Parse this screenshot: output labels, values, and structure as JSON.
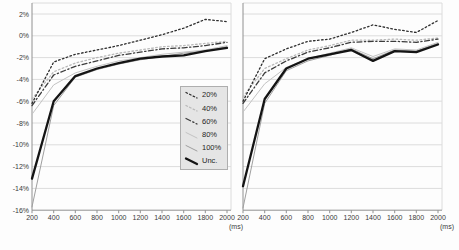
{
  "figure": {
    "background": "#fdfdfd",
    "grid_color": "#dcdcdc",
    "axis_color": "#909090",
    "text_color": "#3a3a3a",
    "legend_bg": "#e5e5e5",
    "legend_border": "#aeaeae",
    "y_axis": {
      "tick_labels": [
        "2%",
        "0%",
        "-2%",
        "-4%",
        "-6%",
        "-8%",
        "-10%",
        "-12%",
        "-14%",
        "-16%"
      ],
      "tick_values": [
        2,
        0,
        -2,
        -4,
        -6,
        -8,
        -10,
        -12,
        -14,
        -16
      ],
      "max": 3,
      "min": -16
    },
    "x_axis": {
      "tick_labels": [
        "200",
        "400",
        "600",
        "800",
        "1000",
        "1200",
        "1400",
        "1600",
        "1800",
        "2000"
      ],
      "tick_values": [
        200,
        400,
        600,
        800,
        1000,
        1200,
        1400,
        1600,
        1800,
        2000
      ],
      "unit_label": "(ms)"
    },
    "legend": [
      {
        "label": "20%",
        "color": "#2d2d2d",
        "pattern": "dotted",
        "weight": "normal"
      },
      {
        "label": "40%",
        "color": "#b9b9b9",
        "pattern": "dotted",
        "weight": "normal"
      },
      {
        "label": "60%",
        "color": "#3c3c3c",
        "pattern": "dashdot",
        "weight": "normal"
      },
      {
        "label": "80%",
        "color": "#c3c3c3",
        "pattern": "solid",
        "weight": "thin"
      },
      {
        "label": "100%",
        "color": "#9f9f9f",
        "pattern": "solid",
        "weight": "thin"
      },
      {
        "label": "Unc.",
        "color": "#141414",
        "pattern": "solid",
        "weight": "thick"
      }
    ]
  },
  "chart_data": [
    {
      "type": "line",
      "panel": "left",
      "xlabel": "(ms)",
      "ylim": [
        -16,
        3
      ],
      "x": [
        200,
        400,
        600,
        800,
        1000,
        1200,
        1400,
        1600,
        1800,
        2000
      ],
      "series": [
        {
          "name": "20%",
          "values": [
            -6.2,
            -2.4,
            -1.7,
            -1.3,
            -0.9,
            -0.4,
            0.1,
            0.7,
            1.5,
            1.3
          ]
        },
        {
          "name": "40%",
          "values": [
            -5.8,
            -3.3,
            -2.5,
            -2.0,
            -1.6,
            -1.3,
            -1.0,
            -0.9,
            -0.7,
            -0.5
          ]
        },
        {
          "name": "60%",
          "values": [
            -6.4,
            -3.6,
            -2.8,
            -2.3,
            -1.8,
            -1.5,
            -1.2,
            -1.1,
            -0.9,
            -0.6
          ]
        },
        {
          "name": "80%",
          "values": [
            -7.2,
            -4.5,
            -3.4,
            -2.8,
            -2.3,
            -2.0,
            -1.7,
            -1.5,
            -1.3,
            -0.9
          ]
        },
        {
          "name": "100%",
          "values": [
            -15.7,
            -6.4,
            -3.8,
            -3.1,
            -2.6,
            -2.2,
            -1.9,
            -1.6,
            -1.4,
            -1.0
          ]
        },
        {
          "name": "Unc.",
          "values": [
            -13.1,
            -6.0,
            -3.7,
            -3.0,
            -2.5,
            -2.1,
            -1.9,
            -1.8,
            -1.4,
            -1.1
          ]
        }
      ]
    },
    {
      "type": "line",
      "panel": "right",
      "xlabel": "(ms)",
      "ylim": [
        -16,
        3
      ],
      "x": [
        200,
        400,
        600,
        800,
        1000,
        1200,
        1400,
        1600,
        1800,
        2000
      ],
      "series": [
        {
          "name": "20%",
          "values": [
            -6.0,
            -2.1,
            -1.2,
            -0.5,
            -0.3,
            0.3,
            1.0,
            0.6,
            0.3,
            1.4
          ]
        },
        {
          "name": "40%",
          "values": [
            -5.6,
            -3.0,
            -2.1,
            -1.3,
            -0.9,
            -0.4,
            -0.4,
            -0.3,
            -0.4,
            -0.2
          ]
        },
        {
          "name": "60%",
          "values": [
            -6.2,
            -3.4,
            -2.3,
            -1.5,
            -1.1,
            -0.6,
            -0.5,
            -0.5,
            -0.6,
            -0.3
          ]
        },
        {
          "name": "80%",
          "values": [
            -7.0,
            -4.4,
            -2.9,
            -2.1,
            -1.6,
            -1.1,
            -1.9,
            -1.2,
            -1.3,
            -0.6
          ]
        },
        {
          "name": "100%",
          "values": [
            -15.8,
            -6.2,
            -3.2,
            -2.3,
            -1.8,
            -1.2,
            -2.1,
            -1.3,
            -1.4,
            -0.7
          ]
        },
        {
          "name": "Unc.",
          "values": [
            -13.8,
            -5.8,
            -3.0,
            -2.1,
            -1.7,
            -1.3,
            -2.3,
            -1.4,
            -1.5,
            -0.8
          ]
        }
      ]
    }
  ]
}
